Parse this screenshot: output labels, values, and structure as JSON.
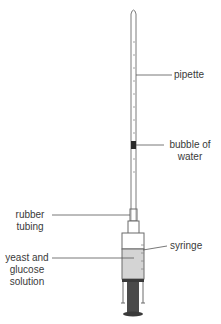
{
  "diagram": {
    "labels": {
      "pipette": "pipette",
      "bubble_line1": "bubble of",
      "bubble_line2": "water",
      "rubber_line1": "rubber",
      "rubber_line2": "tubing",
      "syringe": "syringe",
      "yeast_line1": "yeast and",
      "yeast_line2": "glucose",
      "yeast_line3": "solution"
    },
    "colors": {
      "outline": "#6b6b6b",
      "solution": "#d4d4d4",
      "plunger": "#4a4a4a",
      "bubble": "#2a2a2a",
      "leader": "#555555"
    }
  }
}
